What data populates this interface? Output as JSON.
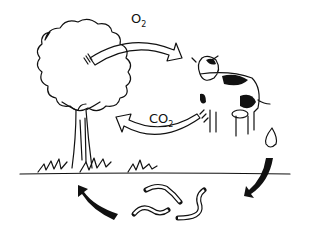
{
  "diagram": {
    "type": "cycle",
    "nodes": [
      {
        "id": "tree",
        "label": "tree"
      },
      {
        "id": "cow",
        "label": "cow"
      },
      {
        "id": "dung",
        "label": "dung"
      },
      {
        "id": "worms",
        "label": "worms"
      }
    ],
    "edges": [
      {
        "from": "tree",
        "to": "cow",
        "label": "O",
        "sub": "2"
      },
      {
        "from": "cow",
        "to": "tree",
        "label": "CO",
        "sub": "2"
      },
      {
        "from": "dung",
        "to": "worms",
        "label": ""
      },
      {
        "from": "worms",
        "to": "tree",
        "label": ""
      }
    ],
    "colors": {
      "ink": "#111111",
      "background": "#ffffff"
    }
  }
}
